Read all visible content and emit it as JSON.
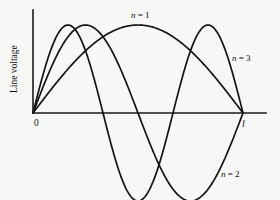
{
  "chart_data": {
    "type": "line",
    "title": "",
    "xlabel": "",
    "ylabel": "Line voltage",
    "x_origin_label": "0",
    "x_end_label": "l",
    "grid": false,
    "legend_position": "inline-annotations",
    "xlim": [
      0,
      1
    ],
    "ylim": [
      -1,
      1
    ],
    "x_axis_overshoot": 0.105,
    "formula": "V(x) = sin(n * pi * x / l)",
    "samples": 241,
    "series": [
      {
        "name": "n = 1",
        "n": 1,
        "label": "n = 1",
        "label_n": "n",
        "label_eq": " = ",
        "label_value": "1",
        "amplitude": 1,
        "nodes": [
          0,
          1
        ],
        "antinodes": [
          0.5
        ],
        "peak_values": [
          1
        ],
        "label_x": 0.5,
        "label_y": 1.18
      },
      {
        "name": "n = 2",
        "n": 2,
        "label": "n = 2",
        "label_n": "n",
        "label_eq": " = ",
        "label_value": "2",
        "amplitude": 1,
        "nodes": [
          0,
          0.5,
          1
        ],
        "antinodes": [
          0.25,
          0.75
        ],
        "peak_values": [
          1,
          -1
        ],
        "label_x": 0.9,
        "label_y": -0.7
      },
      {
        "name": "n = 3",
        "n": 3,
        "label": "n = 3",
        "label_n": "n",
        "label_eq": " = ",
        "label_value": "3",
        "amplitude": 1,
        "nodes": [
          0,
          0.3333,
          0.6667,
          1
        ],
        "antinodes": [
          0.1667,
          0.5,
          0.8333
        ],
        "peak_values": [
          1,
          -1,
          1
        ],
        "label_x": 1.04,
        "label_y": 0.68
      }
    ],
    "colors": {
      "background": "#f7f7f5",
      "axis": "#1a1a1a",
      "curve": "#141414",
      "text": "#101010"
    }
  },
  "geometry": {
    "origin_x": 33,
    "origin_y": 113,
    "end_x": 243,
    "axis_right_x": 266,
    "axis_top_y": 10,
    "amplitude_px": 88
  }
}
